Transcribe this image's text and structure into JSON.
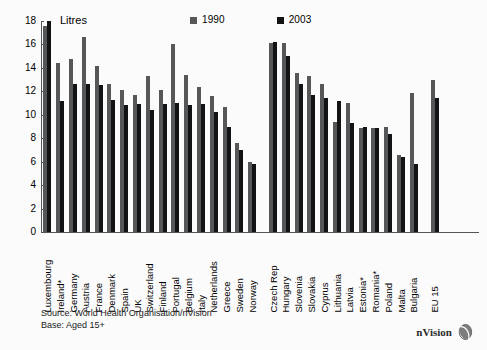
{
  "chart_data": {
    "type": "bar",
    "title": "",
    "xlabel": "",
    "ylabel": "Litres",
    "ylim": [
      0,
      18
    ],
    "yticks": [
      0,
      2,
      4,
      6,
      8,
      10,
      12,
      14,
      16,
      18
    ],
    "grid": false,
    "legend_position": "top-center",
    "categories": [
      "Luxembourg",
      "Ireland*",
      "Germany",
      "Austria",
      "France",
      "Denmark",
      "Spain",
      "UK",
      "Switzerland",
      "Finland",
      "Portugal",
      "Belgium",
      "Italy",
      "Netherlands",
      "Greece",
      "Sweden",
      "Norway",
      "Czech Rep",
      "Hungary",
      "Slovenia",
      "Slovakia",
      "Cyprus",
      "Lithuania",
      "Latvia",
      "Estonia*",
      "Romania*",
      "Poland",
      "Malta",
      "Bulgaria",
      "EU 15"
    ],
    "group_breaks": [
      17,
      29
    ],
    "series": [
      {
        "name": "1990",
        "color": "#555759",
        "values": [
          17.6,
          14.4,
          14.8,
          16.6,
          14.2,
          12.6,
          12.1,
          11.7,
          13.3,
          12.1,
          16.0,
          13.4,
          12.4,
          11.6,
          10.7,
          7.6,
          6.0,
          16.1,
          16.1,
          13.6,
          13.3,
          12.6,
          9.4,
          11.0,
          8.9,
          8.9,
          9.0,
          6.6,
          11.9,
          13.0
        ]
      },
      {
        "name": "2003",
        "color": "#111314",
        "values": [
          18.0,
          11.2,
          12.6,
          12.6,
          12.5,
          11.3,
          10.8,
          10.9,
          10.4,
          10.9,
          11.0,
          10.8,
          10.9,
          10.2,
          9.0,
          7.0,
          5.8,
          16.2,
          15.0,
          12.6,
          11.7,
          11.4,
          11.2,
          9.3,
          9.0,
          8.9,
          8.4,
          6.4,
          5.8,
          11.4
        ]
      }
    ]
  },
  "legend": {
    "items": [
      {
        "label": "1990",
        "color": "#555759"
      },
      {
        "label": "2003",
        "color": "#111314"
      }
    ]
  },
  "axis": {
    "y_unit_label": "Litres"
  },
  "footer": {
    "source": "Source: World Health Organisation/nVision",
    "base": "Base: Aged 15+"
  },
  "brand": {
    "name": "nVision",
    "mark": "nvision-logo-icon"
  }
}
